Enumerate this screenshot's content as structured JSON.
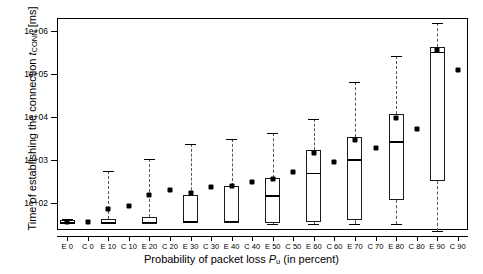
{
  "chart_data": {
    "type": "boxplot",
    "title": "",
    "ylabel": "Time of establishing the connection tCONN [ms]",
    "ylabel_parts": {
      "pre": "Time of establishing the connection ",
      "sym": "t",
      "sub": "CONN",
      "post": " [ms]"
    },
    "xlabel": "Probability of packet loss Pu (in percent)",
    "xlabel_parts": {
      "pre": "Probability of packet loss ",
      "sym": "P",
      "sub": "u",
      "post": " (in percent)"
    },
    "ylim": [
      10,
      3000000
    ],
    "yscale": "log",
    "ytick_labels": [
      "1e+02",
      "1e+03",
      "1e+04",
      "1e+05",
      "1e+06"
    ],
    "ytick_values": [
      100,
      1000,
      10000,
      100000,
      1000000
    ],
    "grid": false,
    "legend": false,
    "categories": [
      "E 0",
      "C 0",
      "E 10",
      "C 10",
      "E 20",
      "C 20",
      "E 30",
      "C 30",
      "E 40",
      "C 40",
      "E 50",
      "C 50",
      "E 60",
      "C 60",
      "E 70",
      "C 70",
      "E 80",
      "C 80",
      "E 90",
      "C 90"
    ],
    "series": [
      {
        "name": "E 0",
        "kind": "box",
        "whisker_low": 33,
        "q1": 33,
        "median": 36,
        "q3": 40,
        "whisker_high": 42,
        "mean": 36
      },
      {
        "name": "C 0",
        "kind": "point",
        "mean": 36
      },
      {
        "name": "E 10",
        "kind": "box",
        "whisker_low": 33,
        "q1": 33,
        "median": 36,
        "q3": 42,
        "whisker_high": 560,
        "mean": 72
      },
      {
        "name": "C 10",
        "kind": "point",
        "mean": 86
      },
      {
        "name": "E 20",
        "kind": "box",
        "whisker_low": 33,
        "q1": 33,
        "median": 37,
        "q3": 48,
        "whisker_high": 1050,
        "mean": 150
      },
      {
        "name": "C 20",
        "kind": "point",
        "mean": 205
      },
      {
        "name": "E 30",
        "kind": "box",
        "whisker_low": 33,
        "q1": 34,
        "median": 38,
        "q3": 150,
        "whisker_high": 2400,
        "mean": 175
      },
      {
        "name": "C 30",
        "kind": "point",
        "mean": 235
      },
      {
        "name": "E 40",
        "kind": "box",
        "whisker_low": 33,
        "q1": 34,
        "median": 39,
        "q3": 250,
        "whisker_high": 3000,
        "mean": 250
      },
      {
        "name": "C 40",
        "kind": "point",
        "mean": 300
      },
      {
        "name": "E 50",
        "kind": "box",
        "whisker_low": 33,
        "q1": 35,
        "median": 150,
        "q3": 390,
        "whisker_high": 4200,
        "mean": 370
      },
      {
        "name": "C 50",
        "kind": "point",
        "mean": 520
      },
      {
        "name": "E 60",
        "kind": "box",
        "whisker_low": 33,
        "q1": 36,
        "median": 510,
        "q3": 1700,
        "whisker_high": 9000,
        "mean": 1450
      },
      {
        "name": "C 60",
        "kind": "point",
        "mean": 900
      },
      {
        "name": "E 70",
        "kind": "box",
        "whisker_low": 33,
        "q1": 40,
        "median": 1050,
        "q3": 3400,
        "whisker_high": 66000,
        "mean": 2900
      },
      {
        "name": "C 70",
        "kind": "point",
        "mean": 1900
      },
      {
        "name": "E 80",
        "kind": "box",
        "whisker_low": 33,
        "q1": 120,
        "median": 2700,
        "q3": 12000,
        "whisker_high": 260000,
        "mean": 9500
      },
      {
        "name": "C 80",
        "kind": "point",
        "mean": 5200
      },
      {
        "name": "E 90",
        "kind": "box",
        "whisker_low": 22,
        "q1": 320,
        "median": 330000,
        "q3": 420000,
        "whisker_high": 1500000,
        "mean": 370000
      },
      {
        "name": "C 90",
        "kind": "point",
        "mean": 125000
      }
    ]
  }
}
